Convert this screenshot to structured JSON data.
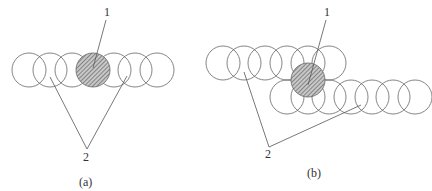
{
  "panels": [
    {
      "id": "a",
      "caption": "(a)",
      "label_hatched": "1",
      "label_plain": "2",
      "circles": [
        {
          "cx": 29,
          "cy": 70,
          "hatched": false
        },
        {
          "cx": 50,
          "cy": 70,
          "hatched": false
        },
        {
          "cx": 72,
          "cy": 70,
          "hatched": false
        },
        {
          "cx": 114,
          "cy": 70,
          "hatched": false
        },
        {
          "cx": 135,
          "cy": 70,
          "hatched": false
        },
        {
          "cx": 157,
          "cy": 70,
          "hatched": false
        },
        {
          "cx": 93,
          "cy": 70,
          "hatched": true
        }
      ]
    },
    {
      "id": "b",
      "caption": "(b)",
      "label_hatched": "1",
      "label_plain": "2",
      "circles": [
        {
          "cx": 223,
          "cy": 63,
          "hatched": false
        },
        {
          "cx": 244,
          "cy": 63,
          "hatched": false
        },
        {
          "cx": 265,
          "cy": 63,
          "hatched": false
        },
        {
          "cx": 287,
          "cy": 63,
          "hatched": false
        },
        {
          "cx": 308,
          "cy": 63,
          "hatched": false
        },
        {
          "cx": 329,
          "cy": 63,
          "hatched": false
        },
        {
          "cx": 287,
          "cy": 97,
          "hatched": false
        },
        {
          "cx": 308,
          "cy": 97,
          "hatched": false
        },
        {
          "cx": 329,
          "cy": 97,
          "hatched": false
        },
        {
          "cx": 351,
          "cy": 97,
          "hatched": false
        },
        {
          "cx": 372,
          "cy": 97,
          "hatched": false
        },
        {
          "cx": 393,
          "cy": 97,
          "hatched": false
        },
        {
          "cx": 415,
          "cy": 97,
          "hatched": false
        },
        {
          "cx": 308,
          "cy": 80,
          "hatched": true
        }
      ]
    }
  ]
}
